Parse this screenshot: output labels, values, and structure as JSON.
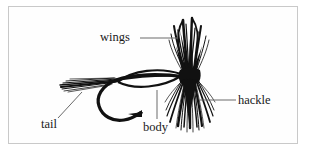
{
  "figure": {
    "background_color": "#ffffff",
    "border_color": "#c9c9c9",
    "ink_color": "#111111",
    "leader_line_color": "#6a6a6a"
  },
  "labels": [
    {
      "id": "wings",
      "text": "wings",
      "leader": "horizontal-right"
    },
    {
      "id": "hackle",
      "text": "hackle",
      "leader": "horizontal-left"
    },
    {
      "id": "tail",
      "text": "tail",
      "leader": "diagonal-up-right"
    },
    {
      "id": "body",
      "text": "body",
      "leader": "vertical-up"
    }
  ],
  "parts": [
    {
      "id": "wings",
      "description": "upright black fiber bundle with two quill loops"
    },
    {
      "id": "hackle",
      "description": "dense black fibers splayed downward at head"
    },
    {
      "id": "tail",
      "description": "straight fibers streaming left from hook bend"
    },
    {
      "id": "body",
      "description": "lens shaped dubbed body along hook shank"
    },
    {
      "id": "hook",
      "description": "curved hook with barbed point facing right"
    }
  ]
}
